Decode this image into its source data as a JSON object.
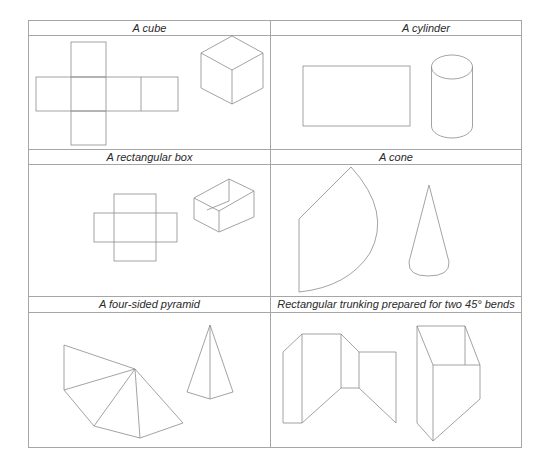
{
  "table": {
    "cells": [
      {
        "title": "A cube"
      },
      {
        "title": "A cylinder"
      },
      {
        "title": "A rectangular box"
      },
      {
        "title": "A cone"
      },
      {
        "title": "A four-sided pyramid"
      },
      {
        "title": "Rectangular trunking prepared for two 45° bends"
      }
    ]
  },
  "colors": {
    "line": "#8c8c8c",
    "border": "#a6a6a6",
    "text": "#2a2a2a",
    "background": "#ffffff"
  }
}
